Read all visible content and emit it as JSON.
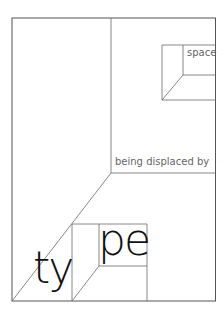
{
  "diagram": {
    "words": {
      "space": "space",
      "being_displaced_by": "being displaced by",
      "ty": "ty",
      "pe": "pe"
    },
    "colors": {
      "line": "#6a6a6a",
      "small_text": "#666666",
      "large_text": "#111111",
      "background": "#ffffff"
    }
  }
}
